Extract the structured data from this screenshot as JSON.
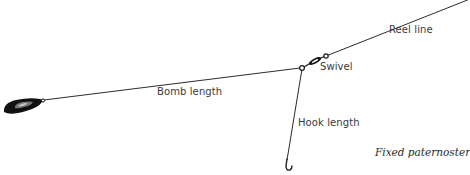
{
  "diagram": {
    "title": "Fixed paternoster",
    "colors": {
      "line": "#2b2b2b",
      "weight": "#111111",
      "text": "#3a3a3a",
      "background": "#ffffff"
    },
    "components": [
      {
        "id": "reel-line",
        "label": "Reel line",
        "icon": "fishing-line"
      },
      {
        "id": "swivel",
        "label": "Swivel",
        "icon": "swivel-icon"
      },
      {
        "id": "bomb-length",
        "label": "Bomb length",
        "icon": "fishing-line"
      },
      {
        "id": "hook-length",
        "label": "Hook length",
        "icon": "fishing-line"
      },
      {
        "id": "bomb",
        "label": "",
        "icon": "lead-weight-icon"
      },
      {
        "id": "hook",
        "label": "",
        "icon": "fish-hook-icon"
      }
    ],
    "labels": {
      "reel_line": "Reel line",
      "swivel": "Swivel",
      "bomb_length": "Bomb length",
      "hook_length": "Hook length",
      "caption": "Fixed paternoster"
    }
  }
}
